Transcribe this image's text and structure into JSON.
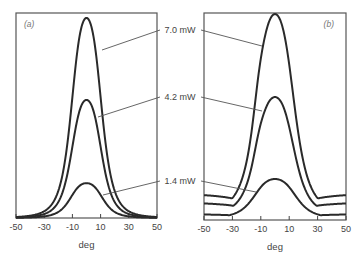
{
  "chart_data": [
    {
      "type": "line",
      "panel_label": "(a)",
      "xlabel": "deg",
      "ylabel": "",
      "xlim": [
        -50,
        50
      ],
      "ylim": [
        0,
        1
      ],
      "xticks": [
        -50,
        -30,
        -10,
        10,
        30,
        50
      ],
      "xtick_labels": [
        "-50",
        "-30",
        "-10",
        "10",
        "30",
        "50"
      ],
      "grid": false,
      "series": [
        {
          "name": "7.0 mW",
          "peak_x": 0,
          "peak_y": 0.976,
          "width": 11.5,
          "tail": 0.0,
          "shoulder": 0
        },
        {
          "name": "4.2 mW",
          "peak_x": 0,
          "peak_y": 0.576,
          "width": 11.5,
          "tail": 0.0,
          "shoulder": 0
        },
        {
          "name": "1.4 mW",
          "peak_x": 0,
          "peak_y": 0.17,
          "width": 12.5,
          "tail": 0.0,
          "shoulder": 0
        }
      ]
    },
    {
      "type": "line",
      "panel_label": "(b)",
      "xlabel": "deg",
      "ylabel": "",
      "xlim": [
        -50,
        50
      ],
      "ylim": [
        0,
        1
      ],
      "xticks": [
        -50,
        -30,
        -10,
        10,
        30,
        50
      ],
      "xtick_labels": [
        "-50",
        "-30",
        "-10",
        "10",
        "30",
        "50"
      ],
      "grid": false,
      "series": [
        {
          "name": "7.0 mW",
          "peak_x": 0,
          "peak_y": 0.995,
          "width": 14.5,
          "tail": 0.09,
          "shoulder": 1
        },
        {
          "name": "4.2 mW",
          "peak_x": 0,
          "peak_y": 0.594,
          "width": 14.5,
          "tail": 0.06,
          "shoulder": 1
        },
        {
          "name": "1.4 mW",
          "peak_x": 0,
          "peak_y": 0.198,
          "width": 16,
          "tail": 0.02,
          "shoulder": 0
        }
      ]
    }
  ],
  "annotations": [
    "7.0 mW",
    "4.2 mW",
    "1.4 mW"
  ]
}
